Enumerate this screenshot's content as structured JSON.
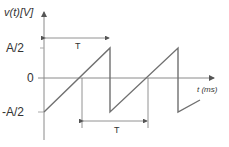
{
  "diagram": {
    "y_axis_label": "v(t)[V]",
    "x_axis_label": "t (ms)",
    "y_ticks": [
      "A/2",
      "0",
      "-A/2"
    ],
    "period_label_top": "T",
    "period_label_bottom": "T",
    "waveform": "sawtooth",
    "colors": {
      "waveform": "#707070",
      "axis": "#8a8a8a",
      "text": "#333333"
    }
  }
}
